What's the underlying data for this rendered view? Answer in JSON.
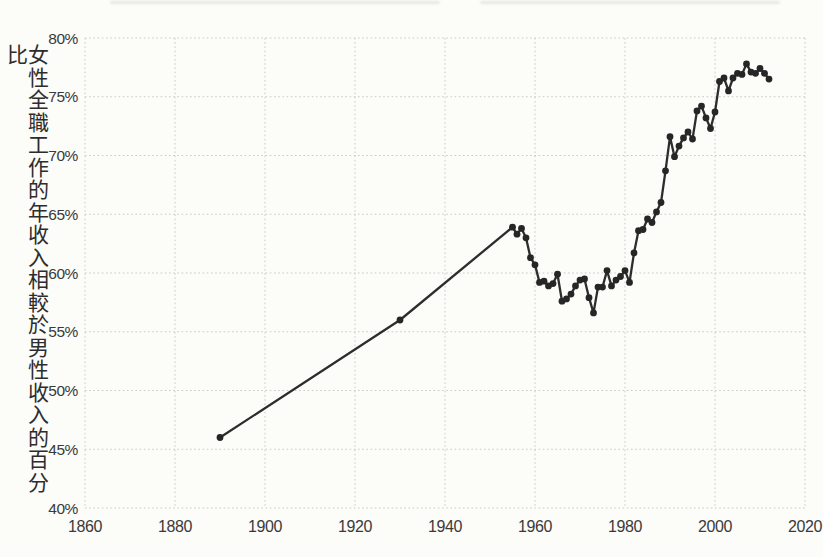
{
  "chart_data": {
    "type": "line",
    "title": "",
    "xlabel": "",
    "ylabel": "女性全職工作的年收入相較於男性收入的百分比",
    "xlim": [
      1860,
      2020
    ],
    "ylim": [
      40,
      80
    ],
    "x_ticks": [
      1860,
      1880,
      1900,
      1920,
      1940,
      1960,
      1980,
      2000,
      2020
    ],
    "y_ticks": [
      40,
      45,
      50,
      55,
      60,
      65,
      70,
      75,
      80
    ],
    "y_tick_suffix": "%",
    "grid": "dotted",
    "legend": "none",
    "colors": {
      "line": "#2d2d2d",
      "point": "#262626",
      "grid": "#c9c9c6",
      "tick_text": "#3a3a3a",
      "background": "#fcfcf9"
    },
    "series": [
      {
        "name": "女性收入相較於男性收入的百分比",
        "points": [
          [
            1890,
            46
          ],
          [
            1930,
            56
          ],
          [
            1955,
            63.9
          ],
          [
            1956,
            63.3
          ],
          [
            1957,
            63.8
          ],
          [
            1958,
            63.0
          ],
          [
            1959,
            61.3
          ],
          [
            1960,
            60.7
          ],
          [
            1961,
            59.2
          ],
          [
            1962,
            59.3
          ],
          [
            1963,
            58.9
          ],
          [
            1964,
            59.1
          ],
          [
            1965,
            59.9
          ],
          [
            1966,
            57.6
          ],
          [
            1967,
            57.8
          ],
          [
            1968,
            58.2
          ],
          [
            1969,
            58.9
          ],
          [
            1970,
            59.4
          ],
          [
            1971,
            59.5
          ],
          [
            1972,
            57.9
          ],
          [
            1973,
            56.6
          ],
          [
            1974,
            58.8
          ],
          [
            1975,
            58.8
          ],
          [
            1976,
            60.2
          ],
          [
            1977,
            58.9
          ],
          [
            1978,
            59.4
          ],
          [
            1979,
            59.7
          ],
          [
            1980,
            60.2
          ],
          [
            1981,
            59.2
          ],
          [
            1982,
            61.7
          ],
          [
            1983,
            63.6
          ],
          [
            1984,
            63.7
          ],
          [
            1985,
            64.6
          ],
          [
            1986,
            64.3
          ],
          [
            1987,
            65.2
          ],
          [
            1988,
            66.0
          ],
          [
            1989,
            68.7
          ],
          [
            1990,
            71.6
          ],
          [
            1991,
            69.9
          ],
          [
            1992,
            70.8
          ],
          [
            1993,
            71.5
          ],
          [
            1994,
            72.0
          ],
          [
            1995,
            71.4
          ],
          [
            1996,
            73.8
          ],
          [
            1997,
            74.2
          ],
          [
            1998,
            73.2
          ],
          [
            1999,
            72.3
          ],
          [
            2000,
            73.7
          ],
          [
            2001,
            76.3
          ],
          [
            2002,
            76.6
          ],
          [
            2003,
            75.5
          ],
          [
            2004,
            76.6
          ],
          [
            2005,
            77.0
          ],
          [
            2006,
            76.9
          ],
          [
            2007,
            77.8
          ],
          [
            2008,
            77.1
          ],
          [
            2009,
            77.0
          ],
          [
            2010,
            77.4
          ],
          [
            2011,
            77.0
          ],
          [
            2012,
            76.5
          ]
        ]
      }
    ]
  }
}
